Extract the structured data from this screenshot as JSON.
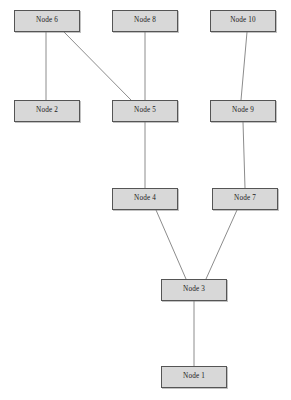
{
  "diagram": {
    "background_color": "#ffffff",
    "node_fill_color": "#d8d8d8",
    "node_border_color": "#555555",
    "node_label_color": "#1a1a1a",
    "edge_color": "#8c8c8c",
    "edge_width": 1,
    "node_width": 66,
    "node_height": 22,
    "nodes": [
      {
        "id": "node6",
        "label": "Node 6",
        "x": 14,
        "y": 10
      },
      {
        "id": "node8",
        "label": "Node 8",
        "x": 112,
        "y": 10
      },
      {
        "id": "node10",
        "label": "Node 10",
        "x": 210,
        "y": 10
      },
      {
        "id": "node2",
        "label": "Node 2",
        "x": 14,
        "y": 100
      },
      {
        "id": "node5",
        "label": "Node 5",
        "x": 112,
        "y": 100
      },
      {
        "id": "node9",
        "label": "Node 9",
        "x": 210,
        "y": 100
      },
      {
        "id": "node4",
        "label": "Node 4",
        "x": 112,
        "y": 188
      },
      {
        "id": "node7",
        "label": "Node 7",
        "x": 212,
        "y": 188
      },
      {
        "id": "node3",
        "label": "Node 3",
        "x": 161,
        "y": 279
      },
      {
        "id": "node1",
        "label": "Node 1",
        "x": 161,
        "y": 366
      }
    ],
    "edges": [
      {
        "id": "edge-node6-node2",
        "from": "node6",
        "to": "node2",
        "x1": 46,
        "y1": 32,
        "x2": 46,
        "y2": 100
      },
      {
        "id": "edge-node6-node5",
        "from": "node6",
        "to": "node5",
        "x1": 64,
        "y1": 32,
        "x2": 131,
        "y2": 100
      },
      {
        "id": "edge-node8-node5",
        "from": "node8",
        "to": "node5",
        "x1": 145,
        "y1": 32,
        "x2": 145,
        "y2": 100
      },
      {
        "id": "edge-node10-node9",
        "from": "node10",
        "to": "node9",
        "x1": 247,
        "y1": 32,
        "x2": 241,
        "y2": 100
      },
      {
        "id": "edge-node5-node4",
        "from": "node5",
        "to": "node4",
        "x1": 145,
        "y1": 122,
        "x2": 145,
        "y2": 188
      },
      {
        "id": "edge-node9-node7",
        "from": "node9",
        "to": "node7",
        "x1": 243,
        "y1": 122,
        "x2": 245,
        "y2": 188
      },
      {
        "id": "edge-node4-node3",
        "from": "node4",
        "to": "node3",
        "x1": 156,
        "y1": 210,
        "x2": 186,
        "y2": 279
      },
      {
        "id": "edge-node7-node3",
        "from": "node7",
        "to": "node3",
        "x1": 237,
        "y1": 210,
        "x2": 206,
        "y2": 279
      },
      {
        "id": "edge-node3-node1",
        "from": "node3",
        "to": "node1",
        "x1": 194,
        "y1": 301,
        "x2": 194,
        "y2": 366
      }
    ]
  }
}
